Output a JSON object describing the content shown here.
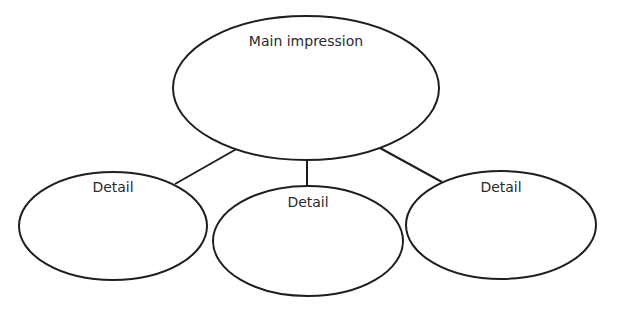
{
  "diagram": {
    "type": "concept-map",
    "main": {
      "label": "Main impression"
    },
    "details": [
      {
        "label": "Detail"
      },
      {
        "label": "Detail"
      },
      {
        "label": "Detail"
      }
    ],
    "colors": {
      "stroke": "#1e1e1e",
      "text": "#2a2a2a",
      "background": "#ffffff"
    }
  }
}
